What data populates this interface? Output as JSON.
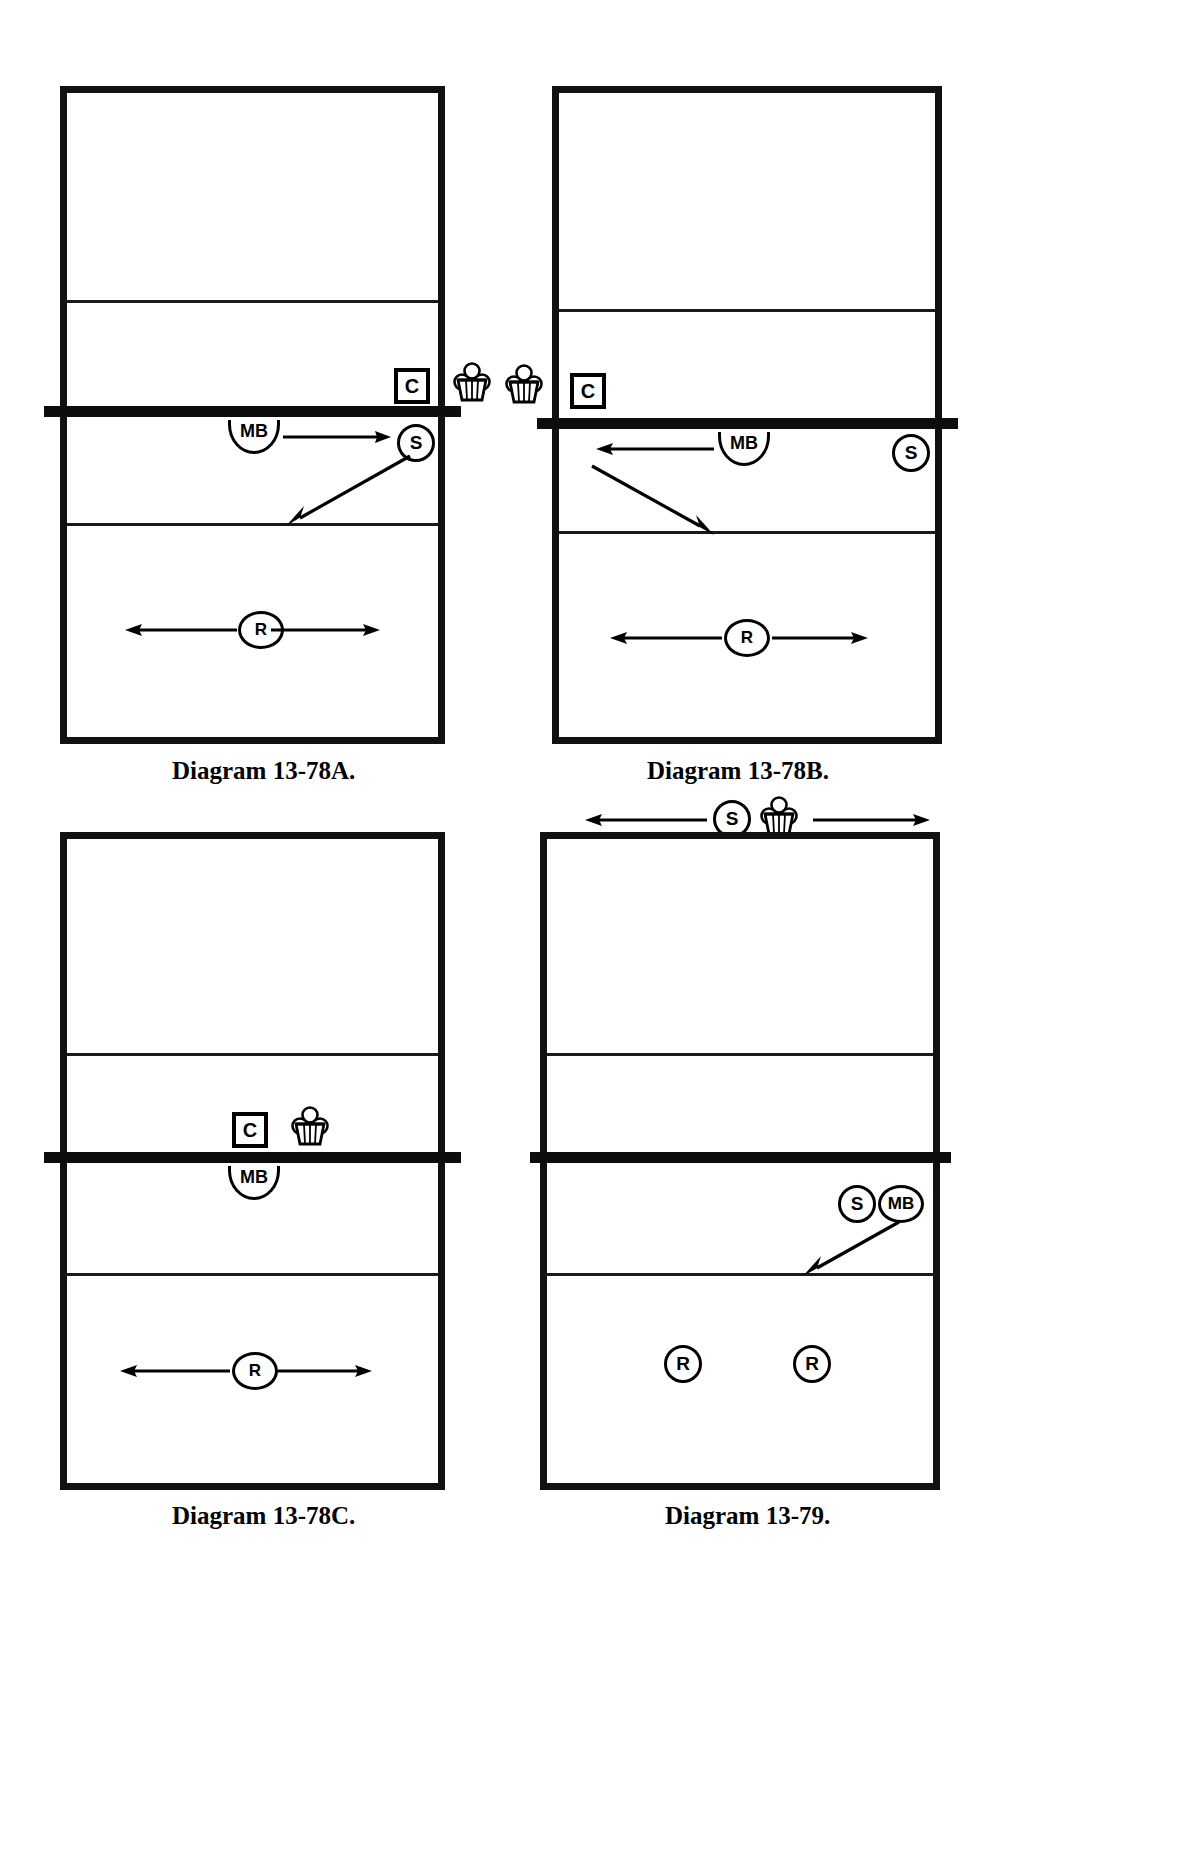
{
  "document": {
    "type": "volleyball-drill-diagrams",
    "page_background": "#ffffff",
    "ink_color": "#000000",
    "diagram_count": 4
  },
  "legend": {
    "coach": "C",
    "middle_blocker": "MB",
    "setter": "S",
    "receiver": "R",
    "ball_cart": "ball-cart-icon"
  },
  "diagrams": [
    {
      "id": "13-78A",
      "caption": "Diagram 13-78A.",
      "markers": {
        "coach": "C",
        "middle_blocker": "MB",
        "setter": "S",
        "receiver": "R"
      },
      "carts": 1,
      "arrows": [
        "MB-moves-right-to-S",
        "S-sets-diagonal-down-left",
        "R-moves-left-and-right"
      ]
    },
    {
      "id": "13-78B",
      "caption": "Diagram 13-78B.",
      "markers": {
        "coach": "C",
        "middle_blocker": "MB",
        "setter": "S",
        "receiver": "R"
      },
      "carts": 1,
      "arrows": [
        "MB-moves-left",
        "set-diagonal-down-right",
        "R-moves-left-and-right"
      ]
    },
    {
      "id": "13-78C",
      "caption": "Diagram 13-78C.",
      "markers": {
        "coach": "C",
        "middle_blocker": "MB",
        "receiver": "R"
      },
      "carts": 1,
      "arrows": [
        "R-moves-left-and-right"
      ]
    },
    {
      "id": "13-79",
      "caption": "Diagram 13-79.",
      "markers": {
        "setter": "S",
        "middle_blocker": "MB",
        "receiver_left": "R",
        "receiver_right": "R"
      },
      "carts": 1,
      "arrows": [
        "setter-cart-moves-left-and-right",
        "attack-diagonal-down-left"
      ]
    }
  ],
  "labels": {
    "c": "C",
    "mb": "MB",
    "s": "S",
    "r": "R"
  },
  "captions": {
    "a": "Diagram 13-78A.",
    "b": "Diagram 13-78B.",
    "c": "Diagram 13-78C.",
    "d": "Diagram 13-79."
  }
}
